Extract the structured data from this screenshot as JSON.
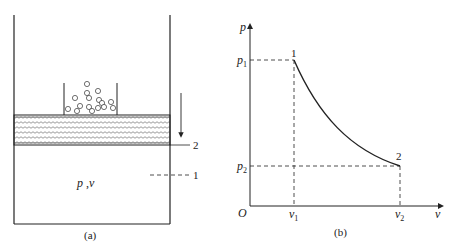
{
  "figure_a": {
    "caption": "(a)",
    "gas_state_label_p": "p",
    "gas_state_sep": " ,",
    "gas_state_label_v": "v",
    "position_2_label": "2",
    "position_1_label": "1",
    "description": "Piston-cylinder with weights (pebbles) on piston; arrow shows piston moving down from position 1 to 2"
  },
  "figure_b": {
    "caption": "(b)",
    "y_axis_label": "p",
    "x_axis_label": "v",
    "origin_label": "O",
    "p1_label": "p",
    "p1_sub": "1",
    "p2_label": "p",
    "p2_sub": "2",
    "v1_label": "v",
    "v1_sub": "1",
    "v2_label": "v",
    "v2_sub": "2",
    "point1_label": "1",
    "point2_label": "2"
  },
  "colors": {
    "line": "#222222",
    "background": "#ffffff"
  }
}
